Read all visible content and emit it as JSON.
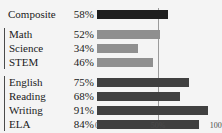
{
  "chart_data": {
    "type": "bar",
    "orientation": "horizontal",
    "title": "",
    "xlabel": "",
    "ylabel": "",
    "xlim": [
      0,
      100
    ],
    "grid": true,
    "gridlines": [
      50
    ],
    "legend": "none",
    "axis_ticks": [
      {
        "value": 0,
        "label": "0"
      },
      {
        "value": 50,
        "label": "50%"
      },
      {
        "value": 100,
        "label": "100%"
      }
    ],
    "groups": [
      {
        "name": "composite",
        "bracket": false,
        "color": "#1f1f1f",
        "rows": [
          {
            "label": "Composite",
            "value": 58,
            "value_label": "58%"
          }
        ]
      },
      {
        "name": "math-group",
        "bracket": true,
        "color": "#8f8f8f",
        "rows": [
          {
            "label": "Math",
            "value": 52,
            "value_label": "52%"
          },
          {
            "label": "Science",
            "value": 34,
            "value_label": "34%"
          },
          {
            "label": "STEM",
            "value": 46,
            "value_label": "46%"
          }
        ]
      },
      {
        "name": "ela-group",
        "bracket": true,
        "color": "#404040",
        "rows": [
          {
            "label": "English",
            "value": 75,
            "value_label": "75%"
          },
          {
            "label": "Reading",
            "value": 68,
            "value_label": "68%"
          },
          {
            "label": "Writing",
            "value": 91,
            "value_label": "91%"
          },
          {
            "label": "ELA",
            "value": 84,
            "value_label": "84%"
          }
        ]
      }
    ],
    "categories": [
      "Composite",
      "Math",
      "Science",
      "STEM",
      "English",
      "Reading",
      "Writing",
      "ELA"
    ],
    "values": [
      58,
      52,
      34,
      46,
      75,
      68,
      91,
      84
    ]
  },
  "colors": {
    "background": "#f4f4f4",
    "text": "#1a1a1a",
    "gridline": "#9b9b9b",
    "bracket": "#4a4a4a",
    "composite_bar": "#1f1f1f",
    "math_bar": "#8f8f8f",
    "ela_bar": "#404040"
  }
}
